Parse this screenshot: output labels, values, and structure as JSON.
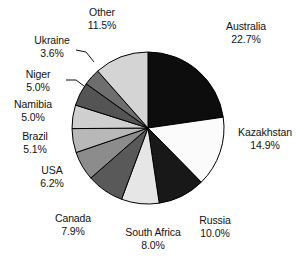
{
  "chart_data": {
    "type": "pie",
    "title": "",
    "subtitle": "",
    "xlabel": "",
    "ylabel": "",
    "legend_position": "none",
    "grid": false,
    "units": "percent",
    "start_angle_deg": 0,
    "direction": "clockwise",
    "categories": [
      "Australia",
      "Kazakhstan",
      "Russia",
      "South Africa",
      "Canada",
      "USA",
      "Brazil",
      "Namibia",
      "Niger",
      "Ukraine",
      "Other"
    ],
    "values": [
      22.7,
      14.9,
      10.0,
      8.0,
      7.9,
      6.2,
      5.1,
      5.0,
      5.0,
      3.6,
      11.5
    ],
    "slices": [
      {
        "label": "Australia",
        "value": 22.7,
        "value_text": "22.7%",
        "color": "#0d0d0d",
        "stroke": "#000000"
      },
      {
        "label": "Kazakhstan",
        "value": 14.9,
        "value_text": "14.9%",
        "color": "#fbfbfb",
        "stroke": "#000000"
      },
      {
        "label": "Russia",
        "value": 10.0,
        "value_text": "10.0%",
        "color": "#181818",
        "stroke": "#000000"
      },
      {
        "label": "South Africa",
        "value": 8.0,
        "value_text": "8.0%",
        "color": "#e6e6e6",
        "stroke": "#000000"
      },
      {
        "label": "Canada",
        "value": 7.9,
        "value_text": "7.9%",
        "color": "#595959",
        "stroke": "#000000"
      },
      {
        "label": "USA",
        "value": 6.2,
        "value_text": "6.2%",
        "color": "#8c8c8c",
        "stroke": "#000000"
      },
      {
        "label": "Brazil",
        "value": 5.1,
        "value_text": "5.1%",
        "color": "#b8b8b8",
        "stroke": "#000000"
      },
      {
        "label": "Namibia",
        "value": 5.0,
        "value_text": "5.0%",
        "color": "#cfcfcf",
        "stroke": "#000000"
      },
      {
        "label": "Niger",
        "value": 5.0,
        "value_text": "5.0%",
        "color": "#545454",
        "stroke": "#000000"
      },
      {
        "label": "Ukraine",
        "value": 3.6,
        "value_text": "3.6%",
        "color": "#6e6e6e",
        "stroke": "#000000"
      },
      {
        "label": "Other",
        "value": 11.5,
        "value_text": "11.5%",
        "color": "#d4d4d4",
        "stroke": "#000000"
      }
    ],
    "geometry": {
      "center_x": 148,
      "center_y": 128,
      "radius": 76
    },
    "colors": {
      "outline": "#000000",
      "text": "#111111",
      "background": "#ffffff"
    }
  }
}
